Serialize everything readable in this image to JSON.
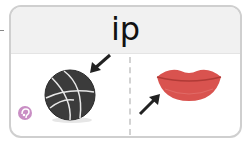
{
  "card": {
    "word": "ip",
    "left_picture": "basketball",
    "right_picture": "lips",
    "arrow_left_target": "basketball",
    "arrow_right_target": "lips"
  },
  "colors": {
    "header_bg": "#f1f1f1",
    "border": "#cfcfcf",
    "ball": "#3a3a3a",
    "lips": "#d9534f",
    "audio_icon": "#c98ec4"
  },
  "icons": {
    "audio": "audio-icon",
    "arrow_left": "arrow-down-left-icon",
    "arrow_right": "arrow-up-right-icon"
  }
}
